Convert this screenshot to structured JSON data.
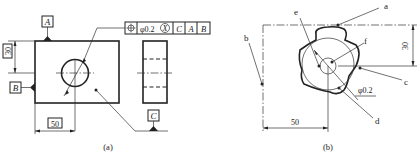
{
  "figure_a": {
    "caption": "(a)",
    "datum_labels": {
      "top": "A",
      "left": "B",
      "bottom_right": "C"
    },
    "dimensions": {
      "vertical": "30",
      "horizontal": "50"
    },
    "feature_control_frame": {
      "symbol": "position-icon",
      "tolerance": "φ0.2",
      "modifier": "X",
      "datums": [
        "C",
        "A",
        "B"
      ]
    }
  },
  "figure_b": {
    "caption": "(b)",
    "labels": [
      "a",
      "b",
      "c",
      "d",
      "e",
      "f"
    ],
    "dimensions": {
      "vertical": "30",
      "horizontal": "50",
      "tolerance_zone": "φ0.2"
    }
  }
}
